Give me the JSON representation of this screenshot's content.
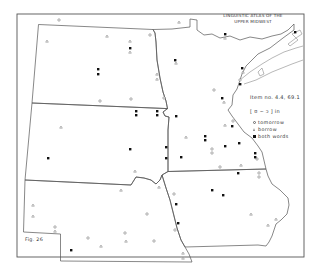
{
  "map": {
    "title_line1": "LINGUISTIC ATLAS OF THE",
    "title_line2": "UPPER MIDWEST",
    "item_number": "Item no. 4.4, 69.1",
    "phonetic": "[ ʊ ~ ɔ ] in",
    "figure": "Fig. 26",
    "legend": [
      {
        "symbol": "open-circle",
        "label": "tomorrow"
      },
      {
        "symbol": "triangle",
        "label": "borrow"
      },
      {
        "symbol": "filled-square",
        "label": "both words"
      }
    ],
    "states": [
      "North Dakota",
      "South Dakota",
      "Nebraska",
      "Minnesota",
      "Iowa"
    ],
    "colors": {
      "ink": "#333333",
      "border": "#555555",
      "background": "#ffffff",
      "water": "#888888"
    }
  }
}
